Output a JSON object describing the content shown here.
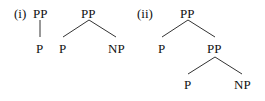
{
  "diagram": {
    "trees": [
      {
        "label": "(i)",
        "nodes": [
          {
            "id": "a_pp",
            "text": "PP"
          },
          {
            "id": "a_p",
            "text": "P"
          }
        ]
      },
      {
        "label": "",
        "nodes": [
          {
            "id": "b_pp",
            "text": "PP"
          },
          {
            "id": "b_p",
            "text": "P"
          },
          {
            "id": "b_np",
            "text": "NP"
          }
        ]
      },
      {
        "label": "(ii)",
        "nodes": [
          {
            "id": "c_pp",
            "text": "PP"
          },
          {
            "id": "c_p",
            "text": "P"
          },
          {
            "id": "c_pp2",
            "text": "PP"
          },
          {
            "id": "c_p2",
            "text": "P"
          },
          {
            "id": "c_np",
            "text": "NP"
          }
        ]
      }
    ]
  }
}
